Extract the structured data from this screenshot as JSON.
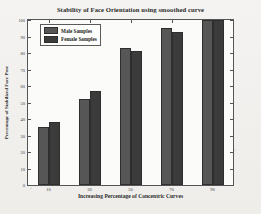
{
  "chart_data": {
    "type": "bar",
    "title": "Stability of Face Orientation using smoothed curve",
    "xlabel": "Increasing Percentage of Concentric Curves",
    "ylabel": "Percentage of Stabilized Face Pose",
    "categories": [
      "10",
      "30",
      "50",
      "70",
      "90"
    ],
    "series": [
      {
        "name": "Male Samples",
        "values": [
          35,
          52,
          83,
          95,
          100
        ],
        "color": "#565656"
      },
      {
        "name": "Female Samples",
        "values": [
          38,
          57,
          81,
          93,
          100
        ],
        "color": "#3b3b3b"
      }
    ],
    "ylim": [
      0,
      100
    ],
    "yticks": [
      "0",
      "10",
      "20",
      "30",
      "40",
      "50",
      "60",
      "70",
      "80",
      "90",
      "100"
    ],
    "xticks": [
      "10",
      "30",
      "50",
      "70",
      "90"
    ],
    "grid": false,
    "legend_position": "top-left",
    "background_color": "#fbfbfa",
    "axis_color": "#555555"
  }
}
